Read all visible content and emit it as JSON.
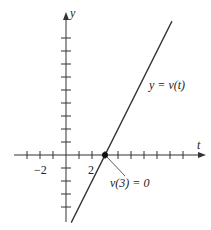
{
  "figure": {
    "x_axis_label": "t",
    "y_axis_label": "y",
    "curve_label": "y = v(t)",
    "point_label": "v(3) = 0",
    "tick_labels": {
      "x_neg": "−2",
      "x_pos": "2"
    }
  },
  "geometry": {
    "origin_px": [
      66,
      155
    ],
    "unit_px": 13,
    "x_ticks": [
      -3,
      -2,
      -1,
      1,
      2,
      3,
      4,
      5,
      6,
      7,
      8,
      9
    ],
    "y_ticks": [
      -4,
      -3,
      -2,
      -1,
      1,
      2,
      3,
      4,
      5,
      6,
      7,
      8,
      9
    ],
    "line": {
      "t0": 0.4,
      "t1": 8.15,
      "slope": 2,
      "intercept": -6
    },
    "point": {
      "t": 3,
      "y": 0
    }
  },
  "colors": {
    "ink": "#222222",
    "background": "#ffffff"
  }
}
